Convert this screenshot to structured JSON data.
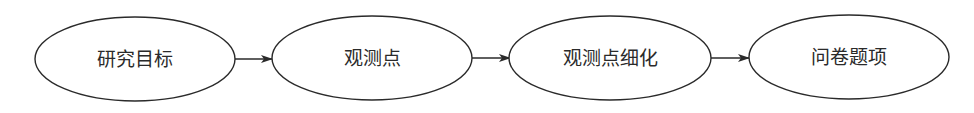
{
  "diagram": {
    "type": "flowchart",
    "direction": "left-to-right",
    "colors": {
      "stroke": "#2a2a2a",
      "fill": "#ffffff",
      "text": "#2a2a2a"
    },
    "nodes": [
      {
        "id": "n1",
        "label": "研究目标",
        "shape": "ellipse"
      },
      {
        "id": "n2",
        "label": "观测点",
        "shape": "ellipse"
      },
      {
        "id": "n3",
        "label": "观测点细化",
        "shape": "ellipse"
      },
      {
        "id": "n4",
        "label": "问卷题项",
        "shape": "ellipse"
      }
    ],
    "edges": [
      {
        "from": "n1",
        "to": "n2"
      },
      {
        "from": "n2",
        "to": "n3"
      },
      {
        "from": "n3",
        "to": "n4"
      }
    ]
  }
}
